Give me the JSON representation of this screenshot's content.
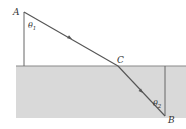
{
  "diagram": {
    "type": "refraction-path",
    "points": {
      "A": {
        "label": "A",
        "x": 24,
        "y": 12
      },
      "C": {
        "label": "C",
        "x": 118,
        "y": 66
      },
      "B": {
        "label": "B",
        "x": 165,
        "y": 116
      }
    },
    "angles": {
      "theta1": {
        "label": "θ1",
        "symbol": "θ",
        "sub": "1"
      },
      "theta2": {
        "label": "θ2",
        "symbol": "θ",
        "sub": "2"
      }
    },
    "medium": {
      "surface_y": 66,
      "color": "#d9d9d9",
      "line_color": "#8a8a8a"
    },
    "line_color": "#555555"
  }
}
